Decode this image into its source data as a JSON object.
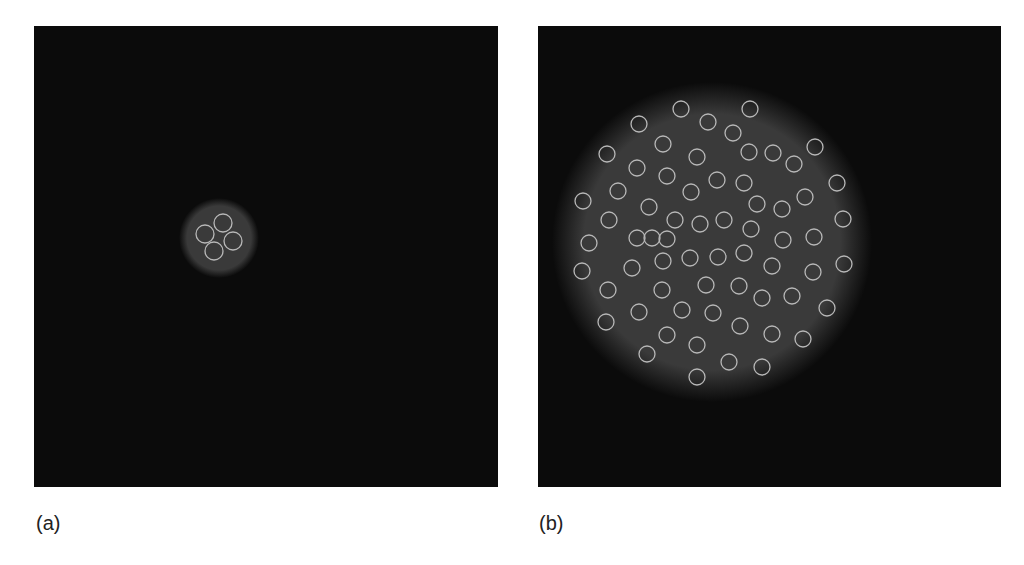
{
  "figure": {
    "panels": [
      {
        "id": "a",
        "label": "(a)",
        "frame": {
          "x": 34,
          "y": 26,
          "w": 464,
          "h": 461
        },
        "background_color": "#0b0b0b",
        "blob": {
          "cx": 185,
          "cy": 212,
          "r": 40,
          "color": "#3a3a3a"
        },
        "ring_color": "#b8b8b8",
        "ring_radius": 9,
        "rings": [
          [
            171,
            208
          ],
          [
            189,
            197
          ],
          [
            199,
            215
          ],
          [
            180,
            225
          ]
        ]
      },
      {
        "id": "b",
        "label": "(b)",
        "frame": {
          "x": 538,
          "y": 26,
          "w": 463,
          "h": 461
        },
        "background_color": "#0b0b0b",
        "blob": {
          "cx": 174,
          "cy": 216,
          "r": 160,
          "color": "#3a3a3a"
        },
        "ring_color": "#b8b8b8",
        "ring_radius": 8,
        "rings": [
          [
            143,
            83
          ],
          [
            212,
            83
          ],
          [
            101,
            98
          ],
          [
            170,
            96
          ],
          [
            195,
            107
          ],
          [
            125,
            118
          ],
          [
            69,
            128
          ],
          [
            159,
            131
          ],
          [
            211,
            126
          ],
          [
            235,
            127
          ],
          [
            277,
            121
          ],
          [
            99,
            142
          ],
          [
            129,
            150
          ],
          [
            179,
            154
          ],
          [
            206,
            157
          ],
          [
            256,
            138
          ],
          [
            299,
            157
          ],
          [
            80,
            165
          ],
          [
            153,
            166
          ],
          [
            267,
            171
          ],
          [
            45,
            175
          ],
          [
            219,
            178
          ],
          [
            111,
            181
          ],
          [
            244,
            183
          ],
          [
            71,
            194
          ],
          [
            137,
            194
          ],
          [
            162,
            198
          ],
          [
            186,
            194
          ],
          [
            305,
            193
          ],
          [
            213,
            203
          ],
          [
            51,
            217
          ],
          [
            99,
            212
          ],
          [
            114,
            212
          ],
          [
            129,
            213
          ],
          [
            245,
            214
          ],
          [
            276,
            211
          ],
          [
            44,
            245
          ],
          [
            94,
            242
          ],
          [
            125,
            235
          ],
          [
            152,
            232
          ],
          [
            180,
            231
          ],
          [
            206,
            227
          ],
          [
            234,
            240
          ],
          [
            275,
            246
          ],
          [
            306,
            238
          ],
          [
            70,
            264
          ],
          [
            124,
            264
          ],
          [
            168,
            259
          ],
          [
            201,
            260
          ],
          [
            224,
            272
          ],
          [
            254,
            270
          ],
          [
            289,
            282
          ],
          [
            101,
            286
          ],
          [
            144,
            284
          ],
          [
            175,
            287
          ],
          [
            68,
            296
          ],
          [
            202,
            300
          ],
          [
            234,
            308
          ],
          [
            265,
            313
          ],
          [
            129,
            309
          ],
          [
            159,
            319
          ],
          [
            109,
            328
          ],
          [
            191,
            336
          ],
          [
            224,
            341
          ],
          [
            159,
            351
          ]
        ]
      }
    ]
  }
}
